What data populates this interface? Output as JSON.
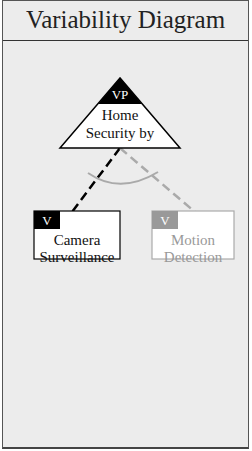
{
  "title": "Variability Diagram",
  "variation_point": {
    "badge": "VP",
    "label_line1": "Home",
    "label_line2": "Security by"
  },
  "variants": [
    {
      "badge": "V",
      "label_line1": "Camera",
      "label_line2": "Surveillance",
      "state": "selected",
      "color": "#000000"
    },
    {
      "badge": "V",
      "label_line1": "Motion",
      "label_line2": "Detection",
      "state": "unselected",
      "color": "#999999"
    }
  ],
  "colors": {
    "selected": "#000000",
    "unselected": "#999999",
    "background": "#ececec"
  }
}
